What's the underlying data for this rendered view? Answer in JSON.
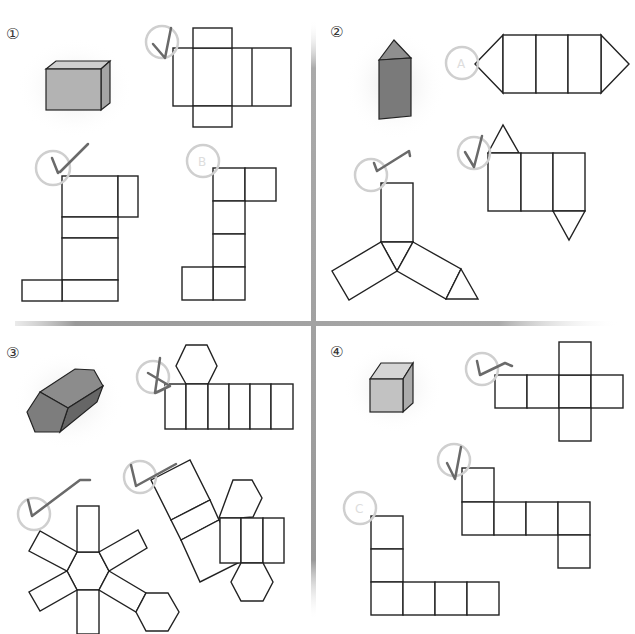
{
  "worksheet": {
    "topic": "Nets of 3D solids",
    "problems": [
      {
        "number": "①",
        "solid": "rectangular prism",
        "solid_color": "#b3b3b3",
        "options": [
          {
            "letter": "A",
            "checked": true,
            "shape": "cross net of rectangular prism"
          },
          {
            "letter": "C",
            "checked": true,
            "shape": "stacked rectangles net"
          },
          {
            "letter": "B",
            "checked": false,
            "shape": "stair net"
          }
        ]
      },
      {
        "number": "②",
        "solid": "triangular prism",
        "solid_color": "#7a7a7a",
        "options": [
          {
            "letter": "A",
            "checked": false,
            "shape": "three rectangles with triangles on both ends"
          },
          {
            "letter": "B",
            "checked": true,
            "shape": "three rectangles with offset triangles"
          },
          {
            "letter": "C",
            "checked": true,
            "shape": "tri-blade net"
          }
        ]
      },
      {
        "number": "③",
        "solid": "hexagonal prism",
        "solid_color": "#7d7d7d",
        "options": [
          {
            "letter": "A",
            "checked": true,
            "shape": "six rectangles with hexagon"
          },
          {
            "letter": "B",
            "checked": true,
            "shape": "split rectangles with two hexagons"
          },
          {
            "letter": "C",
            "checked": true,
            "shape": "star net around hexagon"
          }
        ]
      },
      {
        "number": "④",
        "solid": "cube",
        "solid_color": "#c2c2c2",
        "options": [
          {
            "letter": "A",
            "checked": true,
            "shape": "cross cube net"
          },
          {
            "letter": "B",
            "checked": true,
            "shape": "zigzag cube net"
          },
          {
            "letter": "C",
            "checked": false,
            "shape": "L-shaped net"
          }
        ]
      }
    ]
  },
  "colors": {
    "divider": "#9a9a9a",
    "check": "#6a6a6a",
    "circle": "#cfcfcf",
    "line": "#222222"
  }
}
